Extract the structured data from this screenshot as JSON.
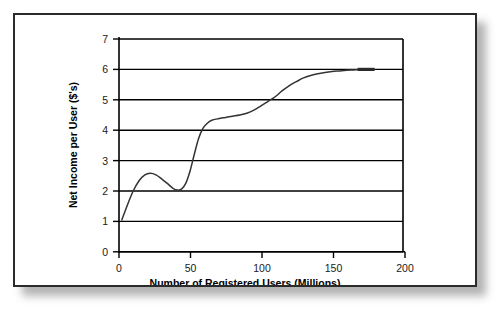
{
  "chart_data": {
    "type": "line",
    "title": "",
    "xlabel": "Number of Registered Users (Millions)",
    "ylabel": "Net Income per User ($'s)",
    "xlim": [
      0,
      200
    ],
    "ylim": [
      0,
      7
    ],
    "xticks": [
      0,
      50,
      100,
      150,
      200
    ],
    "yticks": [
      0,
      1,
      2,
      3,
      4,
      5,
      6,
      7
    ],
    "xtick_labels": [
      "0",
      "50",
      "100",
      "150",
      "200"
    ],
    "ytick_labels": [
      "0",
      "1",
      "2",
      "3",
      "4",
      "5",
      "6",
      "7"
    ],
    "grid": "horizontal",
    "legend": "none",
    "series": [
      {
        "name": "Net income per user",
        "x": [
          2,
          6,
          10,
          14,
          18,
          22,
          26,
          30,
          34,
          38,
          41,
          44,
          47,
          50,
          53,
          56,
          59,
          62,
          65,
          70,
          75,
          80,
          85,
          90,
          95,
          100,
          105,
          110,
          115,
          120,
          125,
          130,
          135,
          140,
          145,
          150,
          155,
          160,
          165,
          170,
          175,
          180
        ],
        "y": [
          1.05,
          1.55,
          2.0,
          2.33,
          2.52,
          2.58,
          2.53,
          2.4,
          2.25,
          2.09,
          2.03,
          2.06,
          2.25,
          2.65,
          3.2,
          3.72,
          4.05,
          4.22,
          4.32,
          4.38,
          4.42,
          4.46,
          4.5,
          4.56,
          4.66,
          4.8,
          4.95,
          5.1,
          5.3,
          5.47,
          5.6,
          5.72,
          5.8,
          5.86,
          5.9,
          5.93,
          5.95,
          5.97,
          5.98,
          5.99,
          6.0,
          6.0
        ]
      }
    ],
    "annotations": {
      "local_max": {
        "x": 22,
        "y": 2.58
      },
      "local_min": {
        "x": 41,
        "y": 2.03
      },
      "asymptote": 6.0,
      "start_point": {
        "x": 2,
        "y": 1.05
      },
      "end_point": {
        "x": 180,
        "y": 6.0
      }
    }
  }
}
